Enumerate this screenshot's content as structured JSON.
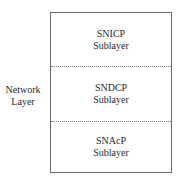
{
  "diagram": {
    "side_label": {
      "line1": "Network",
      "line2": "Layer"
    },
    "sublayers": [
      {
        "name": "SNICP",
        "suffix": "Sublayer"
      },
      {
        "name": "SNDCP",
        "suffix": "Sublayer"
      },
      {
        "name": "SNAcP",
        "suffix": "Sublayer"
      }
    ],
    "colors": {
      "border": "#6a6a6a",
      "divider": "#7a7a7a",
      "text": "#2a2a2a"
    }
  }
}
